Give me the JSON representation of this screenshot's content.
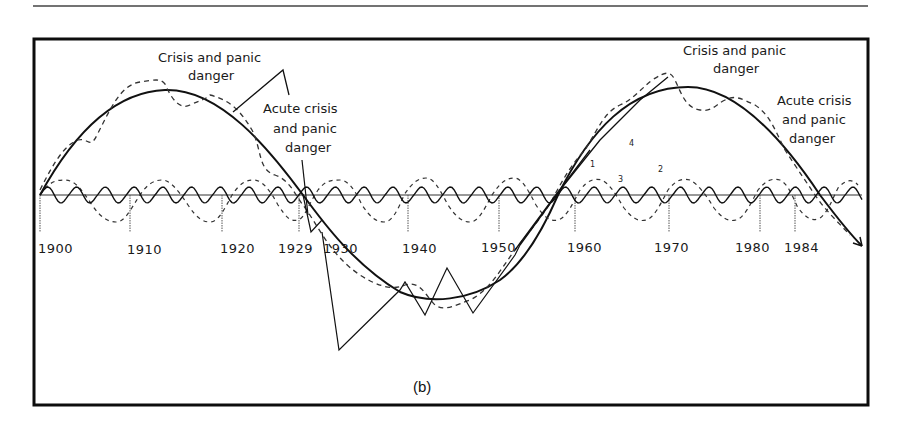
{
  "figure": {
    "panel_label": "(b)",
    "colors": {
      "ink": "#111111",
      "frame": "#0d0d0d",
      "rule": "#333333",
      "background": "#ffffff"
    }
  },
  "annotations": {
    "left_crisis": [
      "Crisis and panic",
      "danger"
    ],
    "left_acute": [
      "Acute crisis",
      "and panic",
      "danger"
    ],
    "right_crisis": [
      "Crisis and panic",
      "danger"
    ],
    "right_acute": [
      "Acute crisis",
      "and panic",
      "danger"
    ],
    "curve_numbers": [
      "1",
      "2",
      "3",
      "4"
    ]
  },
  "chart_data": {
    "type": "line",
    "title": "",
    "xlabel": "",
    "ylabel": "",
    "panel": "(b)",
    "grid": false,
    "legend": "none (curves numbered 1-4 inline)",
    "x_tick_labels": [
      "1900",
      "1910",
      "1920",
      "1929",
      "1930",
      "1940",
      "1950",
      "1960",
      "1970",
      "1980",
      "1984"
    ],
    "x_range": [
      1900,
      1990
    ],
    "y_range": [
      -1,
      1
    ],
    "series": [
      {
        "name": "Long wave (Kondratieff, ~57 yr)",
        "style": "solid thick",
        "x": [
          1900,
          1913,
          1929,
          1943,
          1957,
          1972,
          1986,
          1990
        ],
        "y": [
          0,
          1,
          0,
          -1,
          0,
          1,
          0,
          -0.45
        ]
      },
      {
        "name": "Combined cycles (dashed)",
        "style": "dashed",
        "x": [
          1900,
          1906,
          1911,
          1915,
          1919,
          1929,
          1934,
          1943,
          1957,
          1970,
          1975,
          1980,
          1986,
          1990
        ],
        "y": [
          0,
          0.7,
          1.05,
          0.65,
          0.7,
          0,
          -0.85,
          -1.1,
          0,
          1.1,
          0.65,
          0.55,
          0,
          -0.35
        ]
      },
      {
        "name": "Medium cycle (~9 yr, dashed)",
        "style": "dashed",
        "x": [
          1900,
          1902,
          1904.5,
          1907,
          1909,
          1911,
          1913.5,
          1916,
          1918,
          1920,
          1922.5,
          1925,
          1927,
          1929
        ],
        "y": [
          0,
          0.28,
          0,
          -0.28,
          0,
          0.28,
          0,
          -0.28,
          0,
          0.28,
          0,
          -0.28,
          0,
          0.28
        ]
      },
      {
        "name": "Short cycle (~3 yr, solid thin)",
        "style": "solid thin",
        "period_years": 3.2,
        "amplitude": 0.08
      },
      {
        "name": "Actual 1929-1955 (zig-zag)",
        "style": "solid thin",
        "x": [
          1929,
          1930.5,
          1933,
          1938,
          1941,
          1944,
          1947,
          1950.5
        ],
        "y": [
          0,
          -1.7,
          -1.3,
          -0.75,
          -1.0,
          -0.7,
          -1.0,
          -0.55
        ]
      }
    ],
    "annotations": [
      {
        "text": "Crisis and panic danger",
        "near_x": 1913
      },
      {
        "text": "Acute crisis and panic danger",
        "near_x": 1929
      },
      {
        "text": "Crisis and panic danger",
        "near_x": 1972
      },
      {
        "text": "Acute crisis and panic danger",
        "near_x": 1986
      }
    ]
  }
}
